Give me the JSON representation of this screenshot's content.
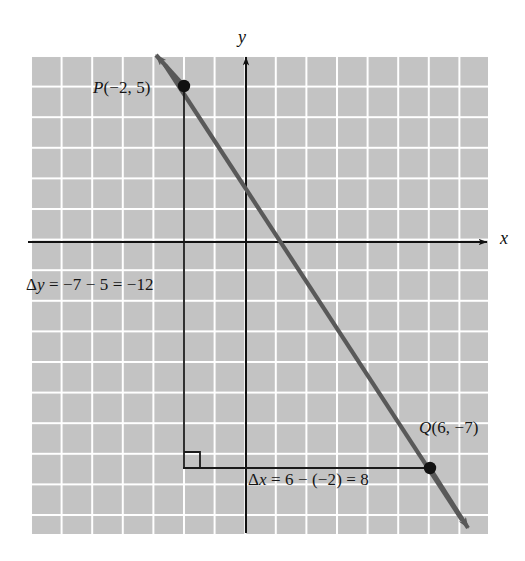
{
  "figure": {
    "type": "coordinate-grid-slope-diagram",
    "background_color": "#ffffff",
    "grid_fill_color": "#c3c3c3",
    "grid_line_color": "#ffffff",
    "axis_color": "#111111",
    "line_color": "#595959",
    "annotation_color": "#151515"
  },
  "axes": {
    "x_label": "x",
    "y_label": "y",
    "x_axis_pixel_y": 242,
    "y_axis_pixel_x": 246
  },
  "labels": {
    "point_p": "P(−2, 5)",
    "point_q": "Q(6, −7)",
    "delta_y": "Δy = −7 − 5 = −12",
    "delta_x": "Δx = 6 − (−2) = 8"
  },
  "chart_data": {
    "type": "line",
    "title": "",
    "xlabel": "x",
    "ylabel": "y",
    "grid": true,
    "legend": "none",
    "xlim": [
      -7,
      8
    ],
    "ylim": [
      -9.5,
      6
    ],
    "grid_spacing": 1,
    "points": [
      {
        "name": "P",
        "x": -2,
        "y": 5,
        "label": "P(−2, 5)"
      },
      {
        "name": "Q",
        "x": 6,
        "y": -7,
        "label": "Q(6, −7)"
      }
    ],
    "series": [
      {
        "name": "line through P and Q",
        "slope": -1.5,
        "intercept": 2,
        "x": [
          -2,
          6
        ],
        "values": [
          5,
          -7
        ],
        "extends_beyond_points": true,
        "arrow_both_ends": true
      }
    ],
    "annotations": [
      {
        "name": "delta-y",
        "text": "Δy = −7 − 5 = −12",
        "value": -12,
        "from": {
          "x": -2,
          "y": 5
        },
        "to": {
          "x": -2,
          "y": -7
        }
      },
      {
        "name": "delta-x",
        "text": "Δx = 6 − (−2) = 8",
        "value": 8,
        "from": {
          "x": -2,
          "y": -7
        },
        "to": {
          "x": 6,
          "y": -7
        }
      },
      {
        "name": "right-angle-marker",
        "text": "",
        "at": {
          "x": -2,
          "y": -7
        }
      }
    ]
  }
}
